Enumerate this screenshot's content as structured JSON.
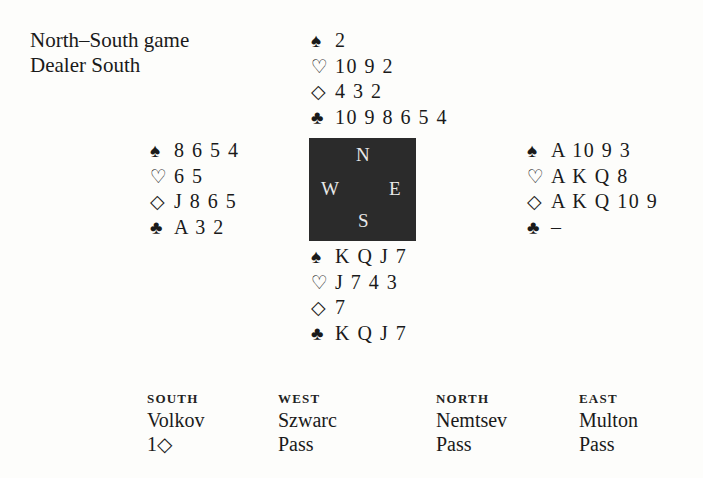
{
  "info": {
    "vulnerability": "North–South game",
    "dealer": "Dealer South"
  },
  "suits": {
    "spades": "♠",
    "hearts": "♡",
    "diamonds": "◇",
    "clubs": "♣"
  },
  "hands": {
    "north": {
      "spades": "2",
      "hearts": "10 9 2",
      "diamonds": "4 3 2",
      "clubs": "10 9 8 6 5 4"
    },
    "west": {
      "spades": "8 6 5 4",
      "hearts": "6 5",
      "diamonds": "J 8 6 5",
      "clubs": "A 3 2"
    },
    "east": {
      "spades": "A 10 9 3",
      "hearts": "A K Q 8",
      "diamonds": "A K Q 10 9",
      "clubs": "–"
    },
    "south": {
      "spades": "K Q J 7",
      "hearts": "J 7 4 3",
      "diamonds": "7",
      "clubs": "K Q J 7"
    }
  },
  "compass": {
    "n": "N",
    "s": "S",
    "w": "W",
    "e": "E",
    "background": "#2b2b2b"
  },
  "auction": {
    "columns": [
      {
        "seat": "SOUTH",
        "player": "Volkov",
        "bids": [
          "1◇"
        ]
      },
      {
        "seat": "WEST",
        "player": "Szwarc",
        "bids": [
          "Pass"
        ]
      },
      {
        "seat": "NORTH",
        "player": "Nemtsev",
        "bids": [
          "Pass"
        ]
      },
      {
        "seat": "EAST",
        "player": "Multon",
        "bids": [
          "Pass"
        ]
      }
    ]
  }
}
